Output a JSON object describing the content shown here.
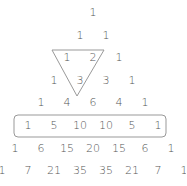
{
  "diagram": {
    "rows": [
      [
        1
      ],
      [
        1,
        1
      ],
      [
        1,
        2,
        1
      ],
      [
        1,
        3,
        3,
        1
      ],
      [
        1,
        4,
        6,
        4,
        1
      ],
      [
        1,
        5,
        10,
        10,
        5,
        1
      ],
      [
        1,
        6,
        15,
        20,
        15,
        6,
        1
      ],
      [
        1,
        7,
        21,
        35,
        35,
        21,
        7,
        1
      ]
    ],
    "highlights": {
      "triangle": {
        "description": "Inverted triangle enclosing 1 and 2 in row 2 and 3 in row 3 (sum rule)",
        "points": [
          [
            52,
            50
          ],
          [
            104,
            50
          ],
          [
            77,
            96
          ]
        ],
        "color": "#999999"
      },
      "row_box": {
        "description": "Rounded rectangle enclosing row 5",
        "row_index": 5,
        "x": 14,
        "y": 115,
        "width": 152,
        "height": 22,
        "color": "#999999"
      }
    },
    "layout": {
      "center_x": 93,
      "row_y": [
        12,
        35,
        57,
        80,
        102,
        125,
        148,
        170
      ],
      "spacing_x": 26
    },
    "text_color": "#555555"
  }
}
